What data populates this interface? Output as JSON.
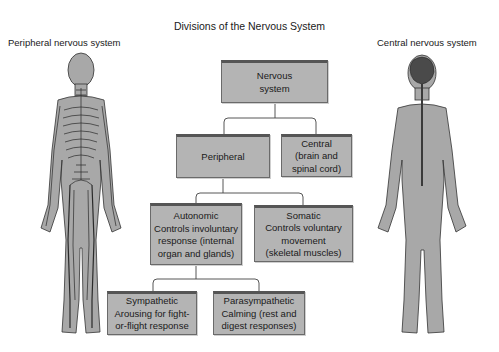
{
  "title": "Divisions of the Nervous System",
  "side_labels": {
    "left": "Peripheral nervous system",
    "right": "Central nervous system"
  },
  "nodes": {
    "nervous_system": {
      "lines": [
        "Nervous",
        "system"
      ]
    },
    "peripheral": {
      "lines": [
        "Peripheral"
      ]
    },
    "central": {
      "lines": [
        "Central",
        "(brain and",
        "spinal cord)"
      ]
    },
    "autonomic": {
      "lines": [
        "Autonomic",
        "Controls involuntary",
        "response (internal",
        "organ and glands)"
      ]
    },
    "somatic": {
      "lines": [
        "Somatic",
        "Controls voluntary",
        "movement",
        "(skeletal muscles)"
      ]
    },
    "sympathetic": {
      "lines": [
        "Sympathetic",
        "Arousing for fight-",
        "or-flight response"
      ]
    },
    "parasympathetic": {
      "lines": [
        "Parasympathetic",
        "Calming (rest and",
        "digest responses)"
      ]
    }
  },
  "hierarchy": [
    {
      "parent": "nervous_system",
      "children": [
        "peripheral",
        "central"
      ]
    },
    {
      "parent": "peripheral",
      "children": [
        "autonomic",
        "somatic"
      ]
    },
    {
      "parent": "autonomic",
      "children": [
        "sympathetic",
        "parasympathetic"
      ]
    }
  ],
  "figures": {
    "left": "body-with-peripheral-nerves",
    "right": "body-with-brain-and-spinal-cord"
  },
  "colors": {
    "box_fill": "#b4b4b4",
    "box_border": "#555555",
    "body_fill": "#a8a8a8",
    "nerve": "#2a2a2a"
  }
}
